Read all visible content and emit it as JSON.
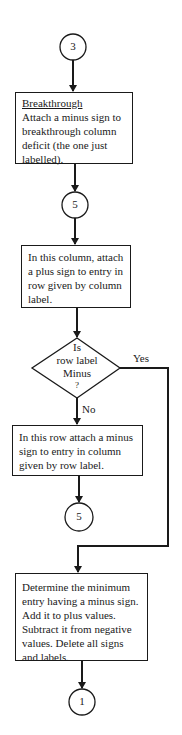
{
  "flowchart": {
    "connectors": {
      "start": "3",
      "mid_top": "5",
      "mid_bottom": "5",
      "end": "1"
    },
    "breakthrough_box": {
      "heading": "Breakthrough",
      "text": "Attach a minus sign to breakthrough column deficit (the one just labelled)."
    },
    "column_box": {
      "text": "In this column, attach a plus sign to entry in row given by column label."
    },
    "decision": {
      "line1": "Is",
      "line2": "row label",
      "line3": "Minus",
      "line4": "?",
      "yes_label": "Yes",
      "no_label": "No"
    },
    "row_box": {
      "text": "In this row attach a minus sign to entry in column given by row label."
    },
    "final_box": {
      "text": "Determine the minimum entry having a minus sign. Add it to plus values. Subtract it from negative values. Delete all signs and labels."
    },
    "colors": {
      "stroke": "#1a1a1a",
      "background": "#ffffff"
    }
  }
}
